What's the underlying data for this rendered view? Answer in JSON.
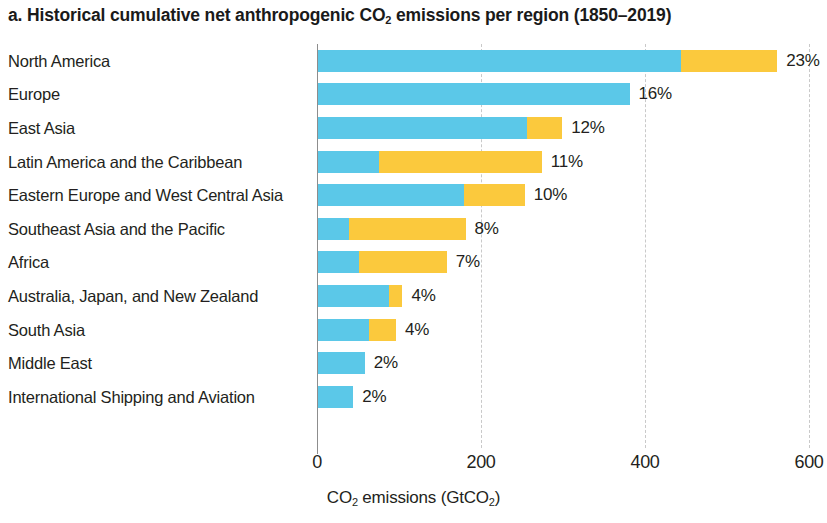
{
  "chart_data": {
    "type": "bar",
    "orientation": "horizontal",
    "stacked": true,
    "title_parts": {
      "prefix": "a. Historical cumulative net anthropogenic CO",
      "sub": "2",
      "suffix": " emissions per region (1850–2019)"
    },
    "xlabel_parts": {
      "p1": "CO",
      "s1": "2",
      "p2": " emissions (GtCO",
      "s2": "2",
      "p3": ")"
    },
    "xlabel": "CO2 emissions (GtCO2)",
    "ylabel": "",
    "xlim": [
      0,
      600
    ],
    "xticks": [
      0,
      200,
      400,
      600
    ],
    "xtick_labels": [
      "0",
      "200",
      "400",
      "600"
    ],
    "grid": "x-dashed",
    "legend": "none",
    "categories": [
      "North America",
      "Europe",
      "East Asia",
      "Latin  America and the Caribbean",
      "Eastern Europe and West Central Asia",
      "Southeast Asia and the Pacific",
      "Africa",
      "Australia, Japan, and New Zealand",
      "South Asia",
      "Middle East",
      "International Shipping and Aviation"
    ],
    "series": [
      {
        "name": "fossil-fuel-and-industry",
        "color": "#5bc8e8",
        "values": [
          443,
          380,
          255,
          74,
          178,
          38,
          50,
          87,
          62,
          57,
          43
        ]
      },
      {
        "name": "land-use-change",
        "color": "#fbc93d",
        "values": [
          117,
          0,
          43,
          199,
          74,
          142,
          107,
          16,
          33,
          0,
          0
        ]
      }
    ],
    "totals": [
      560,
      380,
      298,
      273,
      252,
      180,
      157,
      103,
      95,
      57,
      43
    ],
    "data_labels": [
      "23%",
      "16%",
      "12%",
      "11%",
      "10%",
      "8%",
      "7%",
      "4%",
      "4%",
      "2%",
      "2%"
    ],
    "colors": {
      "blue": "#5bc8e8",
      "yellow": "#fbc93d",
      "axis": "#8d8d8d",
      "grid": "#c9c9c9",
      "text": "#231f20",
      "background": "#ffffff"
    }
  }
}
